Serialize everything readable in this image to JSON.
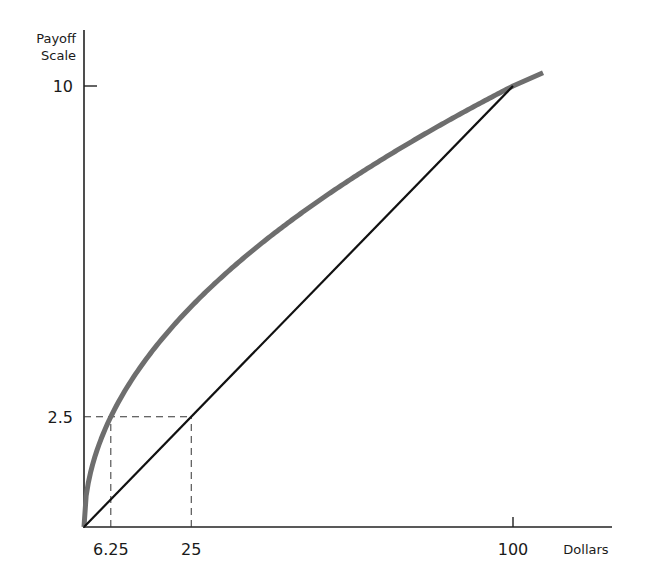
{
  "chart_data": {
    "type": "line",
    "title": "",
    "xlabel": "Dollars",
    "ylabel": "Payoff Scale",
    "ylabel_lines": [
      "Payoff",
      "Scale"
    ],
    "xlim": [
      0,
      107
    ],
    "ylim": [
      0,
      10
    ],
    "grid": false,
    "legend": null,
    "x_ticks": [
      {
        "value": 6.25,
        "label": "6.25",
        "tick_mark": false
      },
      {
        "value": 25,
        "label": "25",
        "tick_mark": false
      },
      {
        "value": 100,
        "label": "100",
        "tick_mark": true
      }
    ],
    "y_ticks": [
      {
        "value": 2.5,
        "label": "2.5",
        "tick_mark": false
      },
      {
        "value": 10,
        "label": "10",
        "tick_mark": true
      }
    ],
    "series": [
      {
        "name": "Utility curve (sqrt)",
        "style": "thick gray curve",
        "color": "#6e6e6e",
        "x": [
          0,
          0.25,
          1,
          2.25,
          4,
          6.25,
          9,
          12.25,
          16,
          20.25,
          25,
          30.25,
          36,
          42.25,
          49,
          56.25,
          64,
          72.25,
          81,
          90.25,
          100,
          107
        ],
        "y": [
          0,
          0.5,
          1,
          1.5,
          2,
          2.5,
          3,
          3.5,
          4,
          4.5,
          5,
          5.5,
          6,
          6.5,
          7,
          7.5,
          8,
          8.5,
          9,
          9.5,
          10,
          10.3
        ]
      },
      {
        "name": "Linear",
        "style": "thin black line",
        "color": "#111111",
        "x": [
          0,
          100
        ],
        "y": [
          0,
          10
        ]
      }
    ],
    "annotations": [
      {
        "type": "dashed-guide",
        "from": [
          0,
          2.5
        ],
        "to": [
          25,
          2.5
        ]
      },
      {
        "type": "dashed-guide",
        "from": [
          6.25,
          0
        ],
        "to": [
          6.25,
          2.5
        ]
      },
      {
        "type": "dashed-guide",
        "from": [
          25,
          0
        ],
        "to": [
          25,
          2.5
        ]
      }
    ]
  }
}
